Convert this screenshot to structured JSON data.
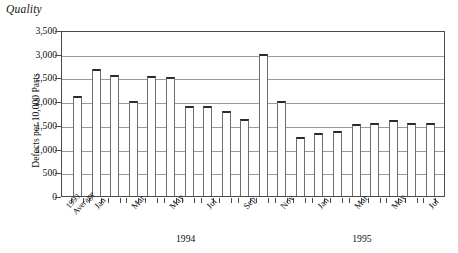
{
  "chart_title": "Quality",
  "axes": {
    "ylabel": "Defects per 10,000 Parts",
    "xlabel": "",
    "ylim": [
      0,
      3500
    ],
    "ytick_labels": [
      "0",
      "500",
      "1,000",
      "1,500",
      "2,000",
      "2,500",
      "3,000",
      "3,500"
    ],
    "grid": true,
    "legend": "none"
  },
  "group_labels": [
    {
      "text": "1994"
    },
    {
      "text": "1995"
    }
  ],
  "chart_data": {
    "type": "bar",
    "title": "Quality",
    "xlabel": "",
    "ylabel": "Defects per 10,000 Parts",
    "ylim": [
      0,
      3500
    ],
    "ytick_interval": 500,
    "grid": true,
    "legend_position": "none",
    "categories": [
      "1993 Average",
      "Jan",
      "Feb",
      "Mar",
      "Apr",
      "May",
      "Jun",
      "Jul",
      "Aug",
      "Sep",
      "Oct",
      "Nov",
      "Dec",
      "Jan",
      "Feb",
      "Mar",
      "Apr",
      "May",
      "Jun",
      "Jul"
    ],
    "tick_labels_shown": [
      "1993 Average",
      "Jan",
      "Mar",
      "May",
      "Jul",
      "Sep",
      "Nov",
      "Jan",
      "Mar",
      "May"
    ],
    "values": [
      2100,
      2680,
      2550,
      2000,
      2520,
      2500,
      1900,
      1900,
      1800,
      1630,
      3000,
      2000,
      1250,
      1330,
      1370,
      1520,
      1550,
      1600,
      1540,
      1540
    ],
    "bars": [
      {
        "label": "1993 Average",
        "group": "",
        "value": 2100
      },
      {
        "label": "Jan",
        "group": "1994",
        "value": 2680
      },
      {
        "label": "Feb",
        "group": "1994",
        "value": 2550
      },
      {
        "label": "Mar",
        "group": "1994",
        "value": 2000
      },
      {
        "label": "Apr",
        "group": "1994",
        "value": 2520
      },
      {
        "label": "May",
        "group": "1994",
        "value": 2500
      },
      {
        "label": "Jun",
        "group": "1994",
        "value": 1900
      },
      {
        "label": "Jul",
        "group": "1994",
        "value": 1900
      },
      {
        "label": "Aug",
        "group": "1994",
        "value": 1800
      },
      {
        "label": "Sep",
        "group": "1994",
        "value": 1630
      },
      {
        "label": "Oct",
        "group": "1994",
        "value": 3000
      },
      {
        "label": "Nov",
        "group": "1994",
        "value": 2000
      },
      {
        "label": "Dec",
        "group": "1995",
        "value": 1250
      },
      {
        "label": "Jan",
        "group": "1995",
        "value": 1330
      },
      {
        "label": "Feb",
        "group": "1995",
        "value": 1370
      },
      {
        "label": "Mar",
        "group": "1995",
        "value": 1520
      },
      {
        "label": "Apr",
        "group": "1995",
        "value": 1550
      },
      {
        "label": "May",
        "group": "1995",
        "value": 1600
      },
      {
        "label": "Jun",
        "group": "1995",
        "value": 1540
      },
      {
        "label": "Jul",
        "group": "1995",
        "value": 1540
      }
    ],
    "colors": {
      "bar_fill": "#ffffff",
      "bar_outline": "#6e6e6e",
      "bar_top": "#2b2b2b",
      "grid": "#9a9a9a",
      "axis": "#4a4a4a",
      "text": "#111111"
    }
  }
}
